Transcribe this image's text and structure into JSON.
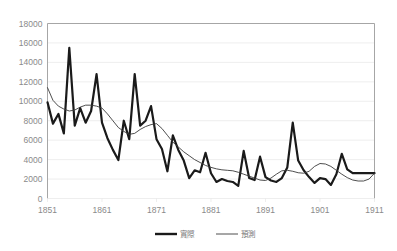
{
  "chart_data": {
    "type": "line",
    "title": "",
    "xlabel": "",
    "ylabel": "",
    "xlim": [
      1851,
      1911
    ],
    "ylim": [
      0,
      18000
    ],
    "grid": true,
    "legend_position": "bottom",
    "y_ticks": [
      "0",
      "2000",
      "4000",
      "6000",
      "8000",
      "10000",
      "12000",
      "14000",
      "16000",
      "18000"
    ],
    "y_tick_values": [
      0,
      2000,
      4000,
      6000,
      8000,
      10000,
      12000,
      14000,
      16000,
      18000
    ],
    "x_ticks": [
      "1851",
      "1861",
      "1871",
      "1881",
      "1891",
      "1901",
      "1911"
    ],
    "x_tick_values": [
      1851,
      1861,
      1871,
      1881,
      1891,
      1901,
      1911
    ],
    "x": [
      1851,
      1852,
      1853,
      1854,
      1855,
      1856,
      1857,
      1858,
      1859,
      1860,
      1861,
      1862,
      1863,
      1864,
      1865,
      1866,
      1867,
      1868,
      1869,
      1870,
      1871,
      1872,
      1873,
      1874,
      1875,
      1876,
      1877,
      1878,
      1879,
      1880,
      1881,
      1882,
      1883,
      1884,
      1885,
      1886,
      1887,
      1888,
      1889,
      1890,
      1891,
      1892,
      1893,
      1894,
      1895,
      1896,
      1897,
      1898,
      1899,
      1900,
      1901,
      1902,
      1903,
      1904,
      1905,
      1906,
      1907,
      1908,
      1909,
      1910,
      1911
    ],
    "series": [
      {
        "name": "實際",
        "style": "thick-solid",
        "color": "#1a1a1a",
        "values": [
          9900,
          7700,
          8700,
          6700,
          15500,
          7500,
          9300,
          7800,
          9000,
          12800,
          7800,
          6200,
          5000,
          3950,
          8000,
          6100,
          12800,
          7500,
          8000,
          9500,
          6100,
          5100,
          2800,
          6500,
          5000,
          3900,
          2100,
          2900,
          2700,
          4700,
          2600,
          1700,
          2000,
          1800,
          1700,
          1300,
          4900,
          2100,
          1900,
          4300,
          2200,
          1850,
          1700,
          2100,
          3200,
          7800,
          3900,
          2900,
          2200,
          1600,
          2100,
          2000,
          1400,
          2500,
          4600,
          3000,
          2600,
          2600,
          2600,
          2600,
          2600
        ]
      },
      {
        "name": "預測",
        "style": "thin-solid",
        "color": "#3a3a3a",
        "values": [
          11400,
          10100,
          9500,
          9200,
          9000,
          9100,
          9400,
          9600,
          9600,
          9500,
          9300,
          8700,
          8000,
          7300,
          6900,
          6600,
          6700,
          7100,
          7400,
          7600,
          7700,
          7200,
          6500,
          5800,
          5300,
          4800,
          4400,
          4000,
          3700,
          3400,
          3200,
          3050,
          2950,
          2900,
          2850,
          2700,
          2500,
          2300,
          2100,
          1900,
          1850,
          2100,
          2500,
          2850,
          2900,
          2800,
          2650,
          2600,
          2800,
          3300,
          3600,
          3550,
          3300,
          2900,
          2500,
          2150,
          1900,
          1800,
          1800,
          2000,
          2600
        ]
      }
    ],
    "legend": [
      {
        "label": "實際",
        "style": "thick-solid"
      },
      {
        "label": "預測",
        "style": "thin-solid"
      }
    ]
  }
}
